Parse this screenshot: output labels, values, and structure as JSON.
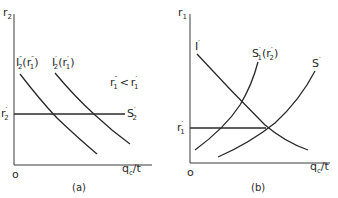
{
  "figure": {
    "panels": [
      {
        "id": "a",
        "caption": "(a)",
        "y_axis_label": "r",
        "y_axis_sub": "2",
        "x_axis_label": "q",
        "x_axis_sub": "c",
        "x_axis_suffix": "/t",
        "origin_label": "o",
        "curves": [
          {
            "label": "I",
            "sub": "2",
            "sup": "″",
            "arg": "(r",
            "arg_sub": "1",
            "arg_sup": "″",
            "arg_close": ")"
          },
          {
            "label": "I",
            "sub": "2",
            "sup": "′",
            "arg": "(r",
            "arg_sub": "1",
            "arg_sup": "′",
            "arg_close": ")"
          },
          {
            "label": "S",
            "sub": "2",
            "sup": "′"
          }
        ],
        "level_label": {
          "label": "r",
          "sub": "2",
          "sup": "′"
        },
        "annotation": {
          "lhs": "r",
          "lhs_sub": "1",
          "lhs_sup": "″",
          "op": "<",
          "rhs": "r",
          "rhs_sub": "1",
          "rhs_sup": "′"
        }
      },
      {
        "id": "b",
        "caption": "(b)",
        "y_axis_label": "r",
        "y_axis_sub": "1",
        "x_axis_label": "q",
        "x_axis_sub": "c",
        "x_axis_suffix": "/t",
        "origin_label": "o",
        "curves": [
          {
            "label": "I",
            "sup": "′"
          },
          {
            "label": "S",
            "sub": "1",
            "sup": "′",
            "arg": "(r",
            "arg_sub": "2",
            "arg_sup": "′",
            "arg_close": ")"
          },
          {
            "label": "S",
            "sup": "′"
          }
        ],
        "level_label": {
          "label": "r",
          "sub": "1",
          "sup": "′"
        }
      }
    ],
    "colors": {
      "ink": "#2a2a2a",
      "background": "#ffffff"
    }
  }
}
